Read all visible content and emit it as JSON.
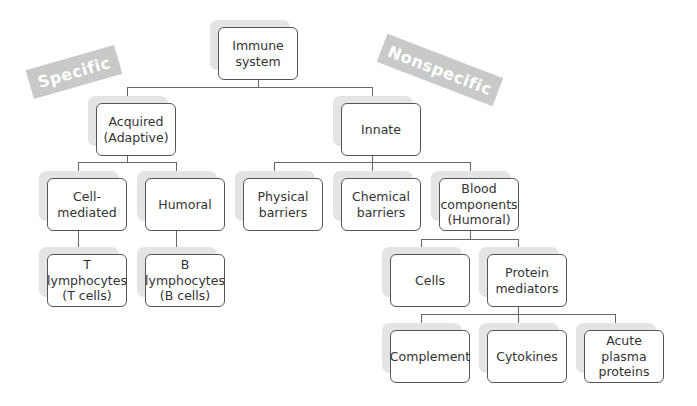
{
  "labels": {
    "specific": "Specific",
    "nonspecific": "Nonspecific"
  },
  "nodes": {
    "immune_system": "Immune\nsystem",
    "acquired": "Acquired\n(Adaptive)",
    "innate": "Innate",
    "cell_mediated": "Cell-\nmediated",
    "humoral": "Humoral",
    "physical_barriers": "Physical\nbarriers",
    "chemical_barriers": "Chemical\nbarriers",
    "blood_components": "Blood\ncomponents\n(Humoral)",
    "t_lymphocytes": "T\nlymphocytes\n(T cells)",
    "b_lymphocytes": "B\nlymphocytes\n(B cells)",
    "cells": "Cells",
    "protein_mediators": "Protein\nmediators",
    "complement": "Complement",
    "cytokines": "Cytokines",
    "acute_plasma_proteins": "Acute\nplasma\nproteins"
  },
  "colors": {
    "tag_bg": "#c9c9c9",
    "shadow": "#e4e4e4",
    "border": "#555555",
    "connector": "#666666"
  }
}
